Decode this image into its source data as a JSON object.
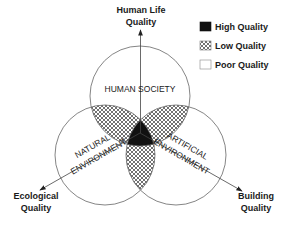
{
  "diagram": {
    "axes": {
      "top": {
        "line1": "Human Life",
        "line2": "Quality"
      },
      "left": {
        "line1": "Ecological",
        "line2": "Quality"
      },
      "right": {
        "line1": "Building",
        "line2": "Quality"
      }
    },
    "circles": {
      "top": "HUMAN SOCIETY",
      "left": {
        "line1": "NATURAL",
        "line2": "ENVIRONMENT"
      },
      "right": {
        "line1": "ARTIFICIAL",
        "line2": "ENVIRONMENT"
      }
    },
    "legend": [
      {
        "label": "High Quality",
        "fill": "solid-black"
      },
      {
        "label": "Low Quality",
        "fill": "crosshatch"
      },
      {
        "label": "Poor Quality",
        "fill": "white"
      }
    ],
    "colors": {
      "line": "#555555",
      "high": "#111111",
      "hatch": "#333333",
      "background": "#ffffff"
    }
  }
}
